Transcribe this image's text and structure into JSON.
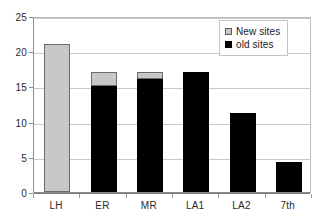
{
  "chart_data": {
    "type": "bar",
    "subtype": "stacked-column",
    "title": "",
    "subtitle": "",
    "xlabel": "",
    "ylabel": "",
    "categories": [
      "LH",
      "ER",
      "MR",
      "LA1",
      "LA2",
      "7th"
    ],
    "series": [
      {
        "name": "old sites",
        "color": "#000000",
        "values": [
          0,
          15,
          16,
          17.1,
          11.2,
          4.2
        ]
      },
      {
        "name": "New sites",
        "color": "#c8c8c8",
        "values": [
          21,
          2.1,
          1.1,
          0,
          0,
          0
        ]
      }
    ],
    "totals": [
      21,
      17.1,
      17.1,
      17.1,
      11.2,
      4.2
    ],
    "ylim": [
      0,
      25
    ],
    "yticks": [
      0,
      5,
      10,
      15,
      20,
      25
    ],
    "ytick_labels": [
      "0",
      "5",
      "10",
      "15",
      "20",
      "25"
    ],
    "grid": true,
    "grid_axis": "y",
    "legend_position": "upper right",
    "legend_entries": [
      "New sites",
      "old sites"
    ]
  },
  "legend": {
    "items": [
      {
        "label": "New sites",
        "swatch": "new-sites-swatch"
      },
      {
        "label": "old sites",
        "swatch": "old-sites-swatch"
      }
    ]
  },
  "colors": {
    "new_sites": "#c8c8c8",
    "old_sites": "#000000",
    "gridline": "#c9c9c9",
    "axis": "#8c8c8c",
    "text": "#2b2b2b",
    "background": "#ffffff"
  }
}
